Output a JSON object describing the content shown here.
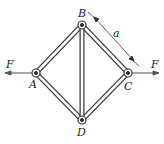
{
  "diagram": {
    "type": "truss",
    "nodes": [
      {
        "id": "A",
        "label": "A",
        "x": 36,
        "y": 73
      },
      {
        "id": "B",
        "label": "B",
        "x": 82,
        "y": 25
      },
      {
        "id": "C",
        "label": "C",
        "x": 128,
        "y": 73
      },
      {
        "id": "D",
        "label": "D",
        "x": 82,
        "y": 120
      }
    ],
    "members": [
      [
        "A",
        "B"
      ],
      [
        "B",
        "C"
      ],
      [
        "C",
        "D"
      ],
      [
        "D",
        "A"
      ],
      [
        "B",
        "D"
      ]
    ],
    "forces": [
      {
        "label": "F",
        "at": "A",
        "direction": "left"
      },
      {
        "label": "F",
        "at": "C",
        "direction": "right"
      }
    ],
    "dimension": {
      "label": "a",
      "member": "B-C"
    },
    "colors": {
      "line": "#333333",
      "fill": "#ffffff"
    }
  }
}
